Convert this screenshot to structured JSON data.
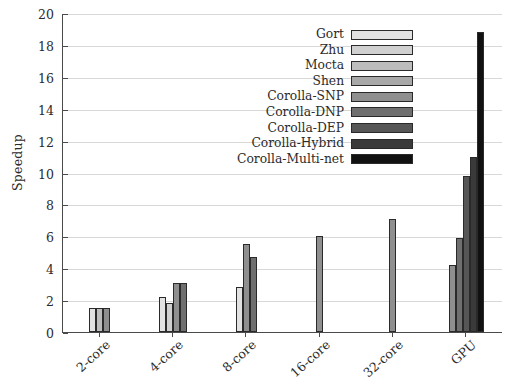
{
  "chart_data": {
    "type": "bar",
    "title": "",
    "xlabel": "",
    "ylabel": "Speedup",
    "ylim": [
      0,
      20
    ],
    "ytick_step": 2,
    "yticks": [
      0,
      2,
      4,
      6,
      8,
      10,
      12,
      14,
      16,
      18,
      20
    ],
    "grid": true,
    "legend_position": "inside-top-center",
    "categories": [
      "2-core",
      "4-core",
      "8-core",
      "16-core",
      "32-core",
      "GPU"
    ],
    "series": [
      {
        "name": "Gort",
        "color": "#e2e2e2",
        "values": [
          1.5,
          2.2,
          2.8,
          null,
          null,
          null
        ]
      },
      {
        "name": "Zhu",
        "color": "#d0d0d0",
        "values": [
          null,
          1.8,
          null,
          null,
          null,
          null
        ]
      },
      {
        "name": "Mocta",
        "color": "#bdbdbd",
        "values": [
          1.5,
          null,
          null,
          null,
          null,
          null
        ]
      },
      {
        "name": "Shen",
        "color": "#a8a8a8",
        "values": [
          null,
          null,
          null,
          null,
          null,
          null
        ]
      },
      {
        "name": "Corolla-SNP",
        "color": "#8f8f8f",
        "values": [
          1.5,
          3.1,
          5.5,
          6.0,
          7.1,
          4.2
        ]
      },
      {
        "name": "Corolla-DNP",
        "color": "#6f6f6f",
        "values": [
          null,
          3.1,
          4.7,
          null,
          null,
          5.9
        ]
      },
      {
        "name": "Corolla-DEP",
        "color": "#565656",
        "values": [
          null,
          null,
          null,
          null,
          null,
          9.8
        ]
      },
      {
        "name": "Corolla-Hybrid",
        "color": "#3a3a3a",
        "values": [
          null,
          null,
          null,
          null,
          null,
          11.0
        ]
      },
      {
        "name": "Corolla-Multi-net",
        "color": "#111111",
        "values": [
          null,
          null,
          null,
          null,
          null,
          18.8
        ]
      }
    ]
  },
  "legend": {
    "items": [
      {
        "label": "Gort"
      },
      {
        "label": "Zhu"
      },
      {
        "label": "Mocta"
      },
      {
        "label": "Shen"
      },
      {
        "label": "Corolla-SNP"
      },
      {
        "label": "Corolla-DNP"
      },
      {
        "label": "Corolla-DEP"
      },
      {
        "label": "Corolla-Hybrid"
      },
      {
        "label": "Corolla-Multi-net"
      }
    ]
  },
  "axes": {
    "y_label": "Speedup"
  }
}
